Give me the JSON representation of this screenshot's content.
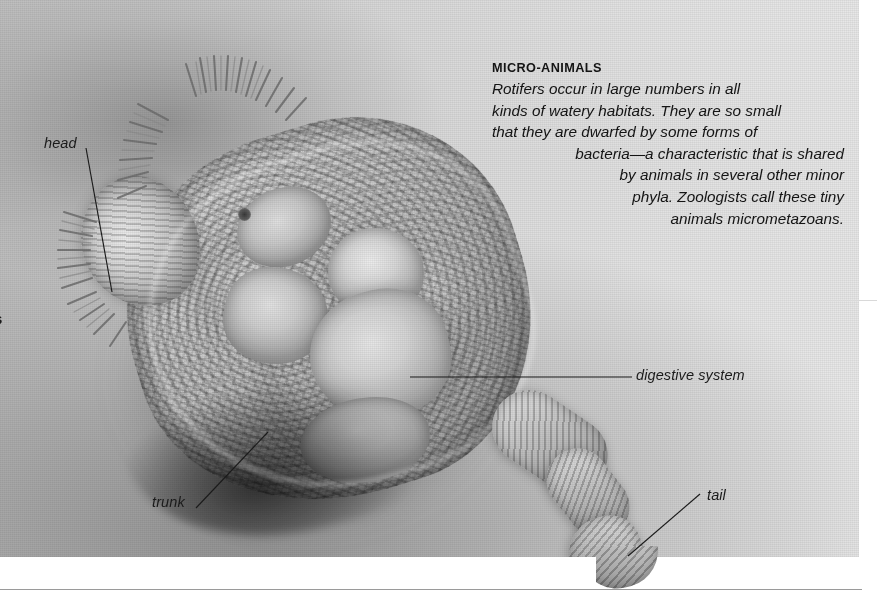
{
  "figure": {
    "caption": {
      "heading": "MICRO-ANIMALS",
      "lines": [
        "Rotifers occur in large numbers in all",
        "kinds of watery habitats. They are so small",
        "that they are dwarfed by some forms of",
        "bacteria—a characteristic that is shared",
        "by animals in several other minor",
        "phyla. Zoologists call these tiny",
        "animals micrometazoans."
      ],
      "full_text": "Rotifers occur in large numbers in all kinds of watery habitats. They are so small that they are dwarfed by some forms of bacteria—a characteristic that is shared by animals in several other minor phyla. Zoologists call these tiny animals micrometazoans."
    },
    "labels": {
      "head": "head",
      "trunk": "trunk",
      "tail": "tail",
      "digestive_system": "digestive system",
      "edge_fragment": "s"
    },
    "colors": {
      "label_text": "#1b1b1b",
      "caption_text": "#141414",
      "leader_line": "#1b1b1b",
      "bottom_rule": "#9a9a9a",
      "faint_rule": "#d9d9d9",
      "page_background": "#ffffff",
      "photo_light": "#e9e9e9",
      "photo_dark": "#b9b9b9"
    }
  }
}
